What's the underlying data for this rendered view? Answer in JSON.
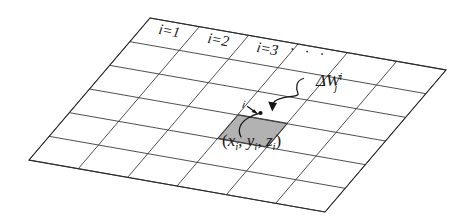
{
  "figure": {
    "background_color": "#ffffff",
    "line_color": "#3c3c3c",
    "shaded_cell_color": "#b2b2b2",
    "grid": {
      "columns": 6,
      "rows": 6,
      "highlight_cell": {
        "column": 3,
        "row": 3
      },
      "corners": {
        "top_left": [
          150,
          18
        ],
        "top_right": [
          446,
          70
        ],
        "bottom_right": [
          321,
          208
        ],
        "bottom_left": [
          29,
          160
        ]
      }
    },
    "column_labels": [
      {
        "id": "col-1",
        "text": "i=1",
        "var": "i",
        "eq": "=1"
      },
      {
        "id": "col-2",
        "text": "i=2",
        "var": "i",
        "eq": "=2"
      },
      {
        "id": "col-3",
        "text": "i=3",
        "var": "i",
        "eq": "=3"
      },
      {
        "id": "col-4",
        "text": "· · · ·"
      }
    ],
    "annotations": {
      "cell_index": {
        "text": "i"
      },
      "increment": {
        "base": "ΔW",
        "superscript": "i",
        "subscript": "j",
        "full_text": "ΔW i j"
      },
      "coordinate": {
        "open": "(",
        "x": "x",
        "x_sub": "i",
        "y": "y",
        "y_sub": "i",
        "z": "z",
        "z_sub": "i",
        "close": ")",
        "full_text": "(x i , y i , z i )"
      }
    }
  }
}
